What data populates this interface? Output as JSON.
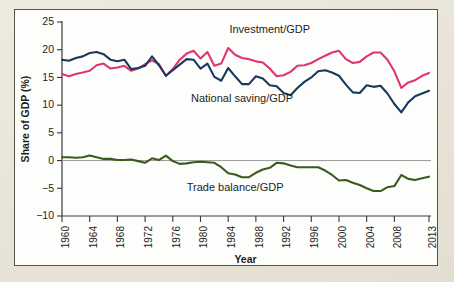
{
  "figure": {
    "panel_background": "#fdfdfb",
    "page_background": "#e9e6da",
    "border_color": "#55544e"
  },
  "chart_data": {
    "type": "line",
    "title": "",
    "xlabel": "Year",
    "ylabel": "Share of GDP (%)",
    "xlim": [
      1960,
      2013
    ],
    "ylim": [
      -10,
      25
    ],
    "yticks": [
      25,
      20,
      15,
      10,
      5,
      0,
      -5,
      -10
    ],
    "ytick_labels": [
      "25",
      "20",
      "15",
      "10",
      "5",
      "0",
      "−5",
      "−10"
    ],
    "xticks": [
      1960,
      1964,
      1968,
      1972,
      1976,
      1980,
      1984,
      1988,
      1992,
      1996,
      2000,
      2004,
      2008,
      2013
    ],
    "xtick_labels": [
      "1960",
      "1964",
      "1968",
      "1972",
      "1976",
      "1980",
      "1984",
      "1988",
      "1992",
      "1996",
      "2000",
      "2004",
      "2008",
      "2013"
    ],
    "grid": false,
    "legend_position": "inline-annotations",
    "zero_line": 0,
    "x": [
      1960,
      1961,
      1962,
      1963,
      1964,
      1965,
      1966,
      1967,
      1968,
      1969,
      1970,
      1971,
      1972,
      1973,
      1974,
      1975,
      1976,
      1977,
      1978,
      1979,
      1980,
      1981,
      1982,
      1983,
      1984,
      1985,
      1986,
      1987,
      1988,
      1989,
      1990,
      1991,
      1992,
      1993,
      1994,
      1995,
      1996,
      1997,
      1998,
      1999,
      2000,
      2001,
      2002,
      2003,
      2004,
      2005,
      2006,
      2007,
      2008,
      2009,
      2010,
      2011,
      2012,
      2013
    ],
    "series": [
      {
        "name": "Investment/GDP",
        "color": "#e0366f",
        "label": "Investment/GDP",
        "values": [
          15.6,
          15.2,
          15.6,
          15.9,
          16.2,
          17.2,
          17.5,
          16.6,
          16.8,
          17.1,
          16.2,
          16.6,
          17.4,
          18.1,
          17.4,
          15.3,
          16.5,
          18.2,
          19.3,
          19.8,
          18.4,
          19.6,
          17.1,
          17.5,
          20.3,
          19.1,
          18.5,
          18.3,
          17.9,
          17.7,
          16.6,
          15.2,
          15.4,
          16.0,
          17.1,
          17.2,
          17.6,
          18.3,
          18.9,
          19.5,
          19.8,
          18.3,
          17.6,
          17.8,
          18.8,
          19.5,
          19.5,
          18.2,
          16.1,
          13.1,
          14.1,
          14.5,
          15.3,
          15.8
        ]
      },
      {
        "name": "National saving/GDP",
        "color": "#173a5e",
        "label": "National saving/GDP",
        "values": [
          18.2,
          18.0,
          18.5,
          18.8,
          19.4,
          19.6,
          19.2,
          18.2,
          17.9,
          18.2,
          16.5,
          16.7,
          17.1,
          18.8,
          17.2,
          15.3,
          16.3,
          17.3,
          18.3,
          18.2,
          16.6,
          17.5,
          15.1,
          14.4,
          16.7,
          15.2,
          13.8,
          13.8,
          15.2,
          14.8,
          13.6,
          13.4,
          12.2,
          11.8,
          13.1,
          14.2,
          15.0,
          16.1,
          16.3,
          15.9,
          15.3,
          13.7,
          12.3,
          12.2,
          13.6,
          13.3,
          13.5,
          12.1,
          10.2,
          8.7,
          10.5,
          11.6,
          12.1,
          12.6
        ]
      },
      {
        "name": "Trade balance/GDP",
        "color": "#3c5a1e",
        "label": "Trade balance/GDP",
        "values": [
          0.6,
          0.6,
          0.5,
          0.6,
          0.9,
          0.6,
          0.3,
          0.3,
          0.1,
          0.1,
          0.2,
          -0.1,
          -0.4,
          0.4,
          0.1,
          0.9,
          -0.1,
          -0.6,
          -0.5,
          -0.3,
          -0.2,
          -0.3,
          -0.4,
          -1.2,
          -2.3,
          -2.5,
          -3.0,
          -3.0,
          -2.2,
          -1.6,
          -1.3,
          -0.4,
          -0.5,
          -0.9,
          -1.2,
          -1.2,
          -1.2,
          -1.2,
          -1.8,
          -2.6,
          -3.6,
          -3.5,
          -4.0,
          -4.4,
          -5.0,
          -5.5,
          -5.5,
          -4.8,
          -4.6,
          -2.6,
          -3.3,
          -3.5,
          -3.2,
          -2.9
        ]
      }
    ],
    "annotations": [
      {
        "text": "Investment/GDP",
        "year": 1990,
        "value": 23.0,
        "color": "#1d1d1b"
      },
      {
        "text": "National saving/GDP",
        "year": 1986,
        "value": 10.6,
        "color": "#1d1d1b"
      },
      {
        "text": "Trade balance/GDP",
        "year": 1985,
        "value": -5.4,
        "color": "#1d1d1b"
      }
    ]
  }
}
